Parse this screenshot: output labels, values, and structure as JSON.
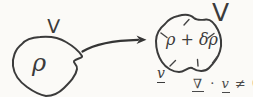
{
  "colors": {
    "background": "#fbfaf7",
    "ink": "#3b3b3b",
    "ink_light": "#4a4a4a"
  },
  "left_volume": {
    "label": "V",
    "density": "ρ"
  },
  "right_volume": {
    "label": "V",
    "density": "ρ + δρ",
    "velocity_label": "v",
    "tick_count": 6
  },
  "equation": {
    "nabla": "∇",
    "dot": "·",
    "velocity": "v",
    "relation": "≠ 0"
  }
}
